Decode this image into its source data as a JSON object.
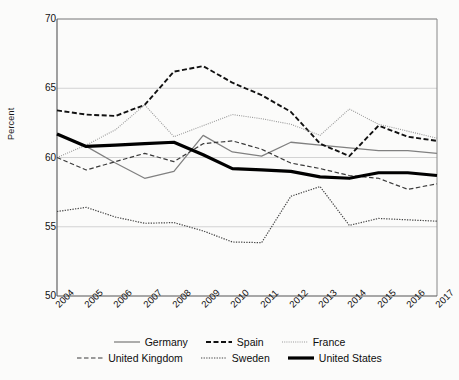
{
  "chart_data": {
    "type": "line",
    "title": "",
    "xlabel": "",
    "ylabel": "Percent",
    "ylim": [
      50,
      70
    ],
    "yticks": [
      50,
      55,
      60,
      65,
      70
    ],
    "grid": true,
    "legend_position": "bottom",
    "x": [
      "2004",
      "2005",
      "2006",
      "2007",
      "2008",
      "2009",
      "2010",
      "2011",
      "2012",
      "2013",
      "2014",
      "2015",
      "2016",
      "2017"
    ],
    "series": [
      {
        "name": "Germany",
        "style": "solid-thin",
        "color": "#808080",
        "values": [
          61.7,
          60.8,
          59.6,
          58.5,
          59.0,
          61.6,
          60.4,
          60.1,
          61.1,
          60.9,
          60.7,
          60.5,
          60.5,
          60.3
        ]
      },
      {
        "name": "Spain",
        "style": "dashed",
        "color": "#111111",
        "values": [
          63.4,
          63.1,
          63.0,
          63.8,
          66.2,
          66.6,
          65.4,
          64.5,
          63.3,
          61.0,
          60.1,
          62.3,
          61.5,
          61.2
        ]
      },
      {
        "name": "France",
        "style": "dotted-fine",
        "color": "#999999",
        "values": [
          60.0,
          60.9,
          62.0,
          63.8,
          61.5,
          62.3,
          63.1,
          62.8,
          62.4,
          61.6,
          63.5,
          62.4,
          61.9,
          61.4
        ]
      },
      {
        "name": "United Kingdom",
        "style": "dashed-thin",
        "color": "#3a3a3a",
        "values": [
          60.0,
          59.1,
          59.7,
          60.3,
          59.7,
          61.0,
          61.2,
          60.6,
          59.6,
          59.2,
          58.7,
          58.5,
          57.7,
          58.1
        ]
      },
      {
        "name": "Sweden",
        "style": "dotted",
        "color": "#444444",
        "values": [
          56.1,
          56.4,
          55.7,
          55.25,
          55.3,
          54.7,
          53.9,
          53.85,
          57.2,
          57.9,
          55.1,
          55.6,
          55.5,
          55.4
        ]
      },
      {
        "name": "United States",
        "style": "solid-thick",
        "color": "#000000",
        "values": [
          61.7,
          60.8,
          60.9,
          61.0,
          61.1,
          60.2,
          59.2,
          59.1,
          59.0,
          58.6,
          58.5,
          58.9,
          58.9,
          58.7
        ]
      }
    ]
  },
  "axis": {
    "y_label": "Percent",
    "y_ticks": [
      "70",
      "65",
      "60",
      "55",
      "50"
    ],
    "x_ticks": [
      "2004",
      "2005",
      "2006",
      "2007",
      "2008",
      "2009",
      "2010",
      "2011",
      "2012",
      "2013",
      "2014",
      "2015",
      "2016",
      "2017"
    ]
  },
  "legend": {
    "row1": [
      {
        "label": "Germany",
        "style": "solid-thin"
      },
      {
        "label": "Spain",
        "style": "dashed"
      },
      {
        "label": "France",
        "style": "dotted-fine"
      }
    ],
    "row2": [
      {
        "label": "United Kingdom",
        "style": "dashed-thin"
      },
      {
        "label": "Sweden",
        "style": "dotted"
      },
      {
        "label": "United States",
        "style": "solid-thick"
      }
    ]
  }
}
